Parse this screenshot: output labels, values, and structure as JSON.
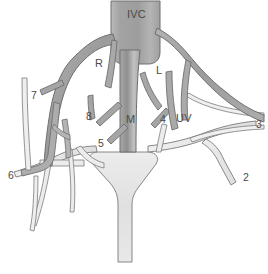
{
  "figure": {
    "type": "anatomical-vessel-diagram",
    "background_color": "#ffffff",
    "colors": {
      "hepatic_vein_fill": "#9a9a9a",
      "hepatic_vein_fill_light": "#b8b8b8",
      "portal_vein_fill": "#e2e2e2",
      "vessel_outline": "#6f6f6f",
      "label_color": "#4a4a4a",
      "ivc_fill": "#a6a6a6"
    }
  },
  "labels": [
    {
      "id": "ivc",
      "text": "IVC",
      "x": 127,
      "y": 9,
      "meaning": "inferior-vena-cava"
    },
    {
      "id": "r",
      "text": "R",
      "x": 95,
      "y": 58,
      "meaning": "right-hepatic-vein"
    },
    {
      "id": "l",
      "text": "L",
      "x": 156,
      "y": 65,
      "meaning": "left-hepatic-vein"
    },
    {
      "id": "m",
      "text": "M",
      "x": 126,
      "y": 114,
      "meaning": "middle-hepatic-vein"
    },
    {
      "id": "uv",
      "text": "UV",
      "x": 176,
      "y": 113,
      "meaning": "umbilical-vein"
    },
    {
      "id": "n8",
      "text": "8",
      "x": 86,
      "y": 111,
      "meaning": "segment-8"
    },
    {
      "id": "n7",
      "text": "7",
      "x": 31,
      "y": 90,
      "meaning": "segment-7"
    },
    {
      "id": "n6",
      "text": "6",
      "x": 8,
      "y": 170,
      "meaning": "segment-6"
    },
    {
      "id": "n5",
      "text": "5",
      "x": 98,
      "y": 138,
      "meaning": "segment-5"
    },
    {
      "id": "n4",
      "text": "4",
      "x": 160,
      "y": 114,
      "meaning": "segment-4"
    },
    {
      "id": "n3",
      "text": "3",
      "x": 256,
      "y": 119,
      "meaning": "segment-3"
    },
    {
      "id": "n2",
      "text": "2",
      "x": 243,
      "y": 172,
      "meaning": "segment-2"
    }
  ]
}
